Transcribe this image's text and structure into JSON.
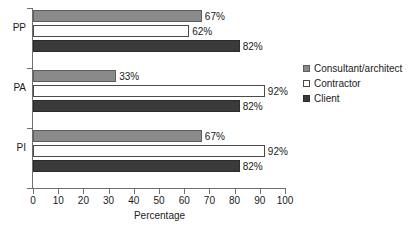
{
  "chart_data": {
    "type": "bar",
    "orientation": "horizontal",
    "title": "",
    "subtitle": "",
    "xlabel": "Percentage",
    "ylabel": "",
    "xlim": [
      0,
      100
    ],
    "xticks": [
      0,
      10,
      20,
      30,
      40,
      50,
      60,
      70,
      80,
      90,
      100
    ],
    "xtick_labels": [
      "0",
      "10",
      "20",
      "30",
      "40",
      "50",
      "60",
      "70",
      "80",
      "90",
      "100"
    ],
    "grid": false,
    "legend_position": "right",
    "categories": [
      "PP",
      "PA",
      "PI"
    ],
    "series": [
      {
        "name": "Consultant/architect",
        "color": "#8a8a8a",
        "values": [
          67,
          33,
          67
        ],
        "labels": [
          "67%",
          "33%",
          "67%"
        ]
      },
      {
        "name": "Contractor",
        "color": "#ffffff",
        "values": [
          62,
          92,
          92
        ],
        "labels": [
          "62%",
          "92%",
          "92%"
        ]
      },
      {
        "name": "Client",
        "color": "#3a3a3a",
        "values": [
          82,
          82,
          82
        ],
        "labels": [
          "82%",
          "82%",
          "82%"
        ]
      }
    ],
    "bars": [
      {
        "category": "PP",
        "series": "Consultant/architect",
        "value": 67,
        "label": "67%"
      },
      {
        "category": "PP",
        "series": "Contractor",
        "value": 62,
        "label": "62%"
      },
      {
        "category": "PP",
        "series": "Client",
        "value": 82,
        "label": "82%"
      },
      {
        "category": "PA",
        "series": "Consultant/architect",
        "value": 33,
        "label": "33%"
      },
      {
        "category": "PA",
        "series": "Contractor",
        "value": 92,
        "label": "92%"
      },
      {
        "category": "PA",
        "series": "Client",
        "value": 82,
        "label": "82%"
      },
      {
        "category": "PI",
        "series": "Consultant/architect",
        "value": 67,
        "label": "67%"
      },
      {
        "category": "PI",
        "series": "Contractor",
        "value": 92,
        "label": "92%"
      },
      {
        "category": "PI",
        "series": "Client",
        "value": 82,
        "label": "82%"
      }
    ]
  },
  "axis": {
    "x_title": "Percentage",
    "ticks": [
      {
        "value": 0,
        "label": "0"
      },
      {
        "value": 10,
        "label": "10"
      },
      {
        "value": 20,
        "label": "20"
      },
      {
        "value": 30,
        "label": "30"
      },
      {
        "value": 40,
        "label": "40"
      },
      {
        "value": 50,
        "label": "50"
      },
      {
        "value": 60,
        "label": "60"
      },
      {
        "value": 70,
        "label": "70"
      },
      {
        "value": 80,
        "label": "80"
      },
      {
        "value": 90,
        "label": "90"
      },
      {
        "value": 100,
        "label": "100"
      }
    ]
  },
  "categories": [
    {
      "label": "PP"
    },
    {
      "label": "PA"
    },
    {
      "label": "PI"
    }
  ],
  "legend": {
    "items": [
      {
        "label": "Consultant/architect",
        "key": "consultant",
        "color": "#8a8a8a"
      },
      {
        "label": "Contractor",
        "key": "contractor",
        "color": "#ffffff"
      },
      {
        "label": "Client",
        "key": "client",
        "color": "#3a3a3a"
      }
    ]
  },
  "colors": {
    "consultant": "#8a8a8a",
    "contractor": "#ffffff",
    "client": "#3a3a3a",
    "axis": "#6f6f6f",
    "text": "#1a1a1a",
    "background": "#ffffff"
  }
}
